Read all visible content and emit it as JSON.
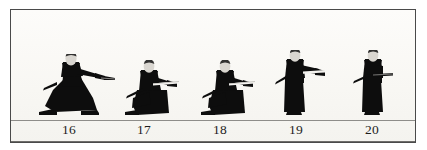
{
  "plate": {
    "background_color": "#fbfaf7",
    "border_color": "#4a4a4a",
    "ground_line_color": "#8e8d8a",
    "figure_color": "#0d0d0d",
    "head_color": "#d9d6d0",
    "blade_color": "#f5f4f1"
  },
  "figures": [
    {
      "id": "figure-16",
      "label": "16",
      "pose": "deep kneeling lunge, right arm extended forward holding sword hilt",
      "x": 36,
      "width": 66,
      "height": 62
    },
    {
      "id": "figure-17",
      "label": "17",
      "pose": "seated kneeling, sword drawn horizontally across front",
      "x": 115,
      "width": 58,
      "height": 56
    },
    {
      "id": "figure-18",
      "label": "18",
      "pose": "seated kneeling, sword drawn horizontally across front",
      "x": 191,
      "width": 58,
      "height": 56
    },
    {
      "id": "figure-19",
      "label": "19",
      "pose": "standing upright, arms extended forward presenting sword",
      "x": 268,
      "width": 50,
      "height": 66
    },
    {
      "id": "figure-20",
      "label": "20",
      "pose": "standing upright, sword held across body near waist",
      "x": 344,
      "width": 50,
      "height": 66
    }
  ],
  "labels": {
    "row_numbers": [
      "16",
      "17",
      "18",
      "19",
      "20"
    ]
  }
}
